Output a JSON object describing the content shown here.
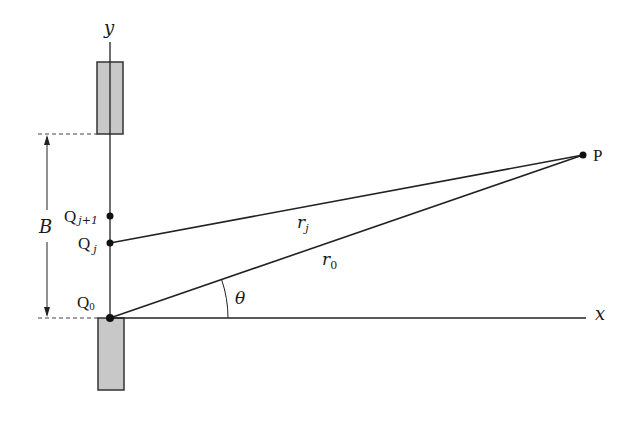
{
  "diagram": {
    "type": "slit-diffraction-geometry",
    "axes": {
      "x_label": "x",
      "y_label": "y"
    },
    "points": [
      {
        "id": "Q0",
        "label_main": "Q",
        "label_sub": "0"
      },
      {
        "id": "Qj",
        "label_main": "Q",
        "label_sub": "j"
      },
      {
        "id": "Qj1",
        "label_main": "Q",
        "label_sub": "j+1"
      },
      {
        "id": "P",
        "label_main": "P",
        "label_sub": ""
      }
    ],
    "segments": [
      {
        "from": "Qj",
        "to": "P",
        "label_main": "r",
        "label_sub": "j"
      },
      {
        "from": "Q0",
        "to": "P",
        "label_main": "r",
        "label_sub": "0"
      }
    ],
    "angle_label": "θ",
    "width_label": "B",
    "colors": {
      "ink": "#222222",
      "slit_fill": "#c8c8c8",
      "background": "#ffffff"
    }
  }
}
